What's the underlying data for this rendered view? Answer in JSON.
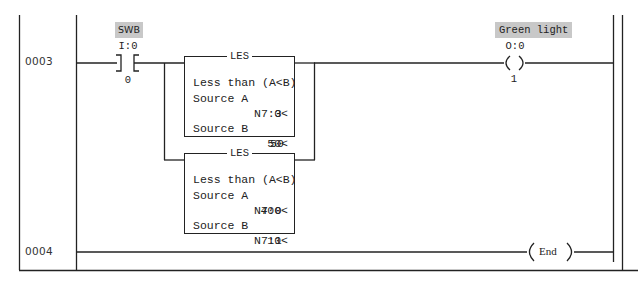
{
  "diagram": {
    "type": "ladder-logic",
    "rungs": [
      {
        "number": "0003",
        "contact": {
          "type": "XIC",
          "symbol_name": "SWB",
          "address": "I:0",
          "bit": "0"
        },
        "branch_instructions": [
          {
            "mnemonic": "LES",
            "description": "Less than (A<B)",
            "source_a_label": "Source A",
            "source_a_address": "N7:3",
            "source_a_value": "0<",
            "source_b_label": "Source B",
            "source_b_address": "50",
            "source_b_value": "50<"
          },
          {
            "mnemonic": "LES",
            "description": "Less than (A<B)",
            "source_a_label": "Source A",
            "source_a_address": "N7:0",
            "source_a_value": "400<",
            "source_b_label": "Source B",
            "source_b_address": "N7:1",
            "source_b_value": "10<"
          }
        ],
        "coil": {
          "type": "OTE",
          "symbol_name": "Green light",
          "address": "O:0",
          "bit": "1"
        }
      },
      {
        "number": "0004",
        "coil": {
          "type": "END",
          "label": "End"
        }
      }
    ]
  },
  "colors": {
    "line": "#222222",
    "label_bg": "#c8c8c8",
    "background": "#ffffff"
  }
}
